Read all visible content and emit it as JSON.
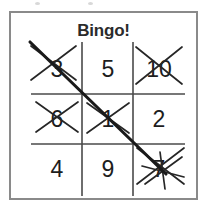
{
  "card": {
    "title": "Bingo!",
    "frame_color": "#8a8a8a",
    "ink_color": "#1d1d1d",
    "background_color": "#ffffff"
  },
  "grid": {
    "rows": 3,
    "columns": 3,
    "cells": [
      {
        "value": "3",
        "marked": true,
        "mark": "x-mark"
      },
      {
        "value": "5",
        "marked": false,
        "mark": ""
      },
      {
        "value": "10",
        "marked": true,
        "mark": "x-mark"
      },
      {
        "value": "6",
        "marked": true,
        "mark": "x-mark"
      },
      {
        "value": "1",
        "marked": true,
        "mark": "x-mark"
      },
      {
        "value": "2",
        "marked": false,
        "mark": ""
      },
      {
        "value": "4",
        "marked": false,
        "mark": ""
      },
      {
        "value": "9",
        "marked": false,
        "mark": ""
      },
      {
        "value": "7",
        "marked": true,
        "mark": "x-mark"
      }
    ]
  },
  "winning_line": {
    "direction": "diagonal-top-left-to-bottom-right",
    "cells": [
      "3",
      "1",
      "7"
    ]
  }
}
